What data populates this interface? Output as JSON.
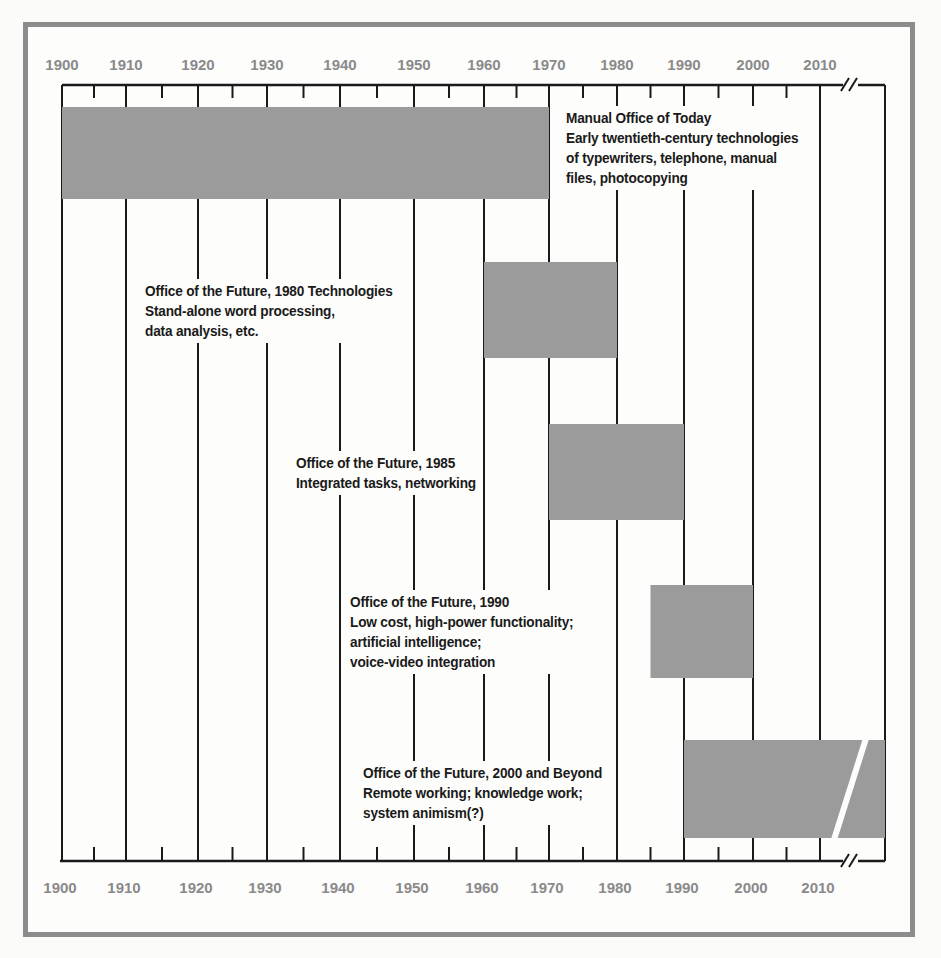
{
  "chart_data": {
    "type": "timeline",
    "title": "",
    "axis": {
      "label": "Year",
      "ticks": [
        "1900",
        "1910",
        "1920",
        "1930",
        "1940",
        "1950",
        "1960",
        "1970",
        "1980",
        "1990",
        "2000",
        "2010"
      ],
      "minor_ticks_every": 5,
      "break_after": "2010",
      "range": [
        1900,
        2018
      ]
    },
    "colors": {
      "bar": "#9b9b9b",
      "frame": "#8c8c8c",
      "axis_text": "#8a8a8a",
      "text": "#1a1a1a"
    },
    "eras": [
      {
        "title": "Manual Office of Today",
        "description": [
          "Early twentieth-century technologies",
          "of typewriters, telephone, manual",
          "files, photocopying"
        ],
        "start": 1900,
        "end": 1970
      },
      {
        "title": "Office of the Future, 1980 Technologies",
        "description": [
          "Stand-alone word processing,",
          "data analysis, etc."
        ],
        "start": 1960,
        "end": 1980
      },
      {
        "title": "Office of the Future, 1985",
        "description": [
          "Integrated tasks, networking"
        ],
        "start": 1970,
        "end": 1990
      },
      {
        "title": "Office of the Future, 1990",
        "description": [
          "Low cost, high-power functionality;",
          "artificial intelligence;",
          "voice-video integration"
        ],
        "start": 1985,
        "end": 2000
      },
      {
        "title": "Office of the Future, 2000 and Beyond",
        "description": [
          "Remote working; knowledge work;",
          "system animism(?)"
        ],
        "start": 1990,
        "end": 2018,
        "open_ended": true
      }
    ]
  }
}
